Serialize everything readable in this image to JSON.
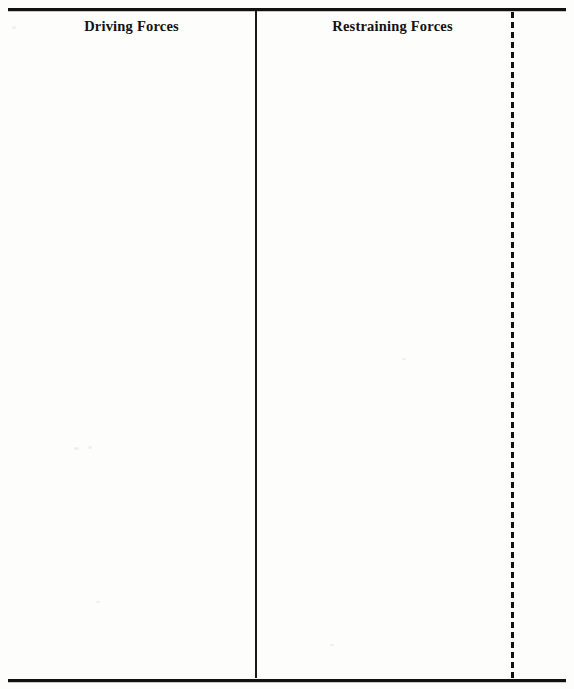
{
  "document": {
    "type": "force-field-analysis-worksheet",
    "background_color": "#fefefe",
    "ink_color": "#141210"
  },
  "table": {
    "columns": [
      {
        "id": "driving-forces",
        "header": "Driving Forces",
        "body_text": ""
      },
      {
        "id": "restraining-forces",
        "header": "Restraining Forces",
        "body_text": ""
      },
      {
        "id": "right-margin",
        "header": "",
        "body_text": ""
      }
    ],
    "rules": {
      "top_rule": "",
      "bottom_rule": "",
      "vertical_divider_solid": "",
      "vertical_divider_dashed": ""
    }
  }
}
